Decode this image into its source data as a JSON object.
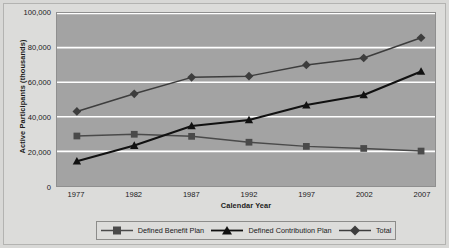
{
  "chart_data": {
    "type": "line",
    "title": "",
    "xlabel": "Calendar Year",
    "ylabel": "Active Participants (thousands)",
    "categories": [
      "1977",
      "1982",
      "1987",
      "1992",
      "1997",
      "2002",
      "2007"
    ],
    "x": [
      1977,
      1982,
      1987,
      1992,
      1997,
      2002,
      2007
    ],
    "ylim": [
      0,
      100000
    ],
    "xlim": [
      1977,
      2007
    ],
    "y_ticks": [
      0,
      20000,
      40000,
      60000,
      80000,
      100000
    ],
    "y_tick_labels": [
      "0",
      "20,000",
      "40,000",
      "60,000",
      "80,000",
      "100,000"
    ],
    "grid": true,
    "grid_color": "#ffffff",
    "plot_background": "#a3a3a3",
    "legend_position": "bottom",
    "series": [
      {
        "name": "Defined Benefit Plan",
        "marker": "square",
        "color": "#4a4a4a",
        "values": [
          28900,
          29900,
          28700,
          25300,
          22900,
          21700,
          20200
        ]
      },
      {
        "name": "Defined Contribution Plan",
        "marker": "triangle",
        "color": "#111111",
        "values": [
          14300,
          23400,
          34700,
          38200,
          46800,
          52600,
          66200
        ]
      },
      {
        "name": "Total",
        "marker": "diamond",
        "color": "#3d3d3d",
        "values": [
          43100,
          53300,
          62800,
          63500,
          70000,
          74000,
          85700
        ]
      }
    ]
  },
  "axes": {
    "y_title": "Active Participants (thousands)",
    "x_title": "Calendar Year",
    "y_tick_labels": [
      "100,000",
      "80,000",
      "60,000",
      "40,000",
      "20,000",
      "0"
    ],
    "x_tick_labels": [
      "1977",
      "1982",
      "1987",
      "1992",
      "1997",
      "2002",
      "2007"
    ]
  },
  "legend": {
    "items": [
      {
        "label": "Defined Benefit Plan",
        "marker": "square-marker-icon",
        "color": "#4a4a4a"
      },
      {
        "label": "Defined Contribution Plan",
        "marker": "triangle-marker-icon",
        "color": "#111111"
      },
      {
        "label": "Total",
        "marker": "diamond-marker-icon",
        "color": "#3d3d3d"
      }
    ]
  }
}
